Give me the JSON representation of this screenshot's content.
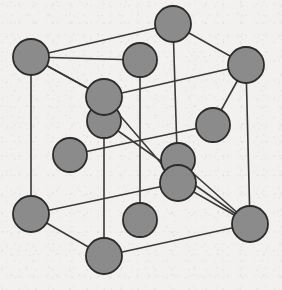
{
  "figure": {
    "canvas": {
      "width": 282,
      "height": 290
    },
    "style": {
      "background_color": "#f2f1ef",
      "atom_fill_color": "#8b8b8b",
      "atom_stroke_color": "#2b2b2b",
      "bond_line_color": "#3a3a3a",
      "atom_radius": 17,
      "bond_line_width": 1.6,
      "atom_stroke_width": 1.8
    },
    "counts": {
      "corner_atoms": 8,
      "face_center_atoms": 6,
      "total_atoms_drawn": 14,
      "cube_edges": 12
    },
    "atoms": [
      {
        "id": "corner-back-top-left",
        "role": "corner",
        "label": "A",
        "x": 31,
        "y": 57
      },
      {
        "id": "corner-front-top-left",
        "role": "corner",
        "label": "B",
        "x": 104,
        "y": 97
      },
      {
        "id": "corner-back-top-right",
        "role": "corner",
        "label": "C",
        "x": 173,
        "y": 24
      },
      {
        "id": "corner-front-top-right",
        "role": "corner",
        "label": "D",
        "x": 246,
        "y": 65
      },
      {
        "id": "corner-back-bottom-left",
        "role": "corner",
        "label": "E",
        "x": 31,
        "y": 214
      },
      {
        "id": "corner-front-bottom-left",
        "role": "corner",
        "label": "F",
        "x": 104,
        "y": 256
      },
      {
        "id": "corner-back-bottom-right",
        "role": "corner",
        "label": "G",
        "x": 178,
        "y": 183
      },
      {
        "id": "corner-front-bottom-right",
        "role": "corner",
        "label": "H",
        "x": 250,
        "y": 224
      },
      {
        "id": "face-center-top",
        "role": "face-center",
        "label": "I",
        "x": 140,
        "y": 60
      },
      {
        "id": "face-center-bottom",
        "role": "face-center",
        "label": "J",
        "x": 140,
        "y": 220
      },
      {
        "id": "face-center-left",
        "role": "face-center",
        "label": "K",
        "x": 70,
        "y": 155
      },
      {
        "id": "face-center-right",
        "role": "face-center",
        "label": "L",
        "x": 213,
        "y": 125
      },
      {
        "id": "face-center-back",
        "role": "face-center",
        "label": "M",
        "x": 104,
        "y": 121
      },
      {
        "id": "face-center-front",
        "role": "face-center",
        "label": "N",
        "x": 178,
        "y": 160
      }
    ],
    "bonds": [
      {
        "id": "edge-top-back",
        "kind": "cube-edge",
        "from": "corner-back-top-left",
        "to": "corner-back-top-right"
      },
      {
        "id": "edge-top-right",
        "kind": "cube-edge",
        "from": "corner-back-top-right",
        "to": "corner-front-top-right"
      },
      {
        "id": "edge-top-front",
        "kind": "cube-edge",
        "from": "corner-front-top-left",
        "to": "corner-front-top-right"
      },
      {
        "id": "edge-top-left",
        "kind": "cube-edge",
        "from": "corner-back-top-left",
        "to": "corner-front-top-left"
      },
      {
        "id": "edge-bottom-back",
        "kind": "cube-edge",
        "from": "corner-back-bottom-left",
        "to": "corner-back-bottom-right"
      },
      {
        "id": "edge-bottom-right",
        "kind": "cube-edge",
        "from": "corner-back-bottom-right",
        "to": "corner-front-bottom-right"
      },
      {
        "id": "edge-bottom-front",
        "kind": "cube-edge",
        "from": "corner-front-bottom-left",
        "to": "corner-front-bottom-right"
      },
      {
        "id": "edge-bottom-left",
        "kind": "cube-edge",
        "from": "corner-back-bottom-left",
        "to": "corner-front-bottom-left"
      },
      {
        "id": "edge-vert-back-left",
        "kind": "cube-edge",
        "from": "corner-back-top-left",
        "to": "corner-back-bottom-left"
      },
      {
        "id": "edge-vert-front-left",
        "kind": "cube-edge",
        "from": "corner-front-top-left",
        "to": "corner-front-bottom-left"
      },
      {
        "id": "edge-vert-back-right",
        "kind": "cube-edge",
        "from": "corner-back-top-right",
        "to": "corner-back-bottom-right"
      },
      {
        "id": "edge-vert-front-right",
        "kind": "cube-edge",
        "from": "corner-front-top-right",
        "to": "corner-front-bottom-right"
      },
      {
        "id": "diag-top-face",
        "kind": "face-diagonal",
        "from": "corner-back-top-left",
        "to": "face-center-top"
      },
      {
        "id": "diag-top-face-2",
        "kind": "face-diagonal",
        "from": "face-center-top",
        "to": "corner-front-top-right"
      },
      {
        "id": "stem-face-top",
        "kind": "face-stem",
        "from": "face-center-top",
        "to": "face-center-bottom"
      },
      {
        "id": "diag-back-face",
        "kind": "face-diagonal",
        "from": "corner-back-top-left",
        "to": "face-center-back"
      },
      {
        "id": "diag-back-face-2",
        "kind": "face-diagonal",
        "from": "face-center-back",
        "to": "corner-front-bottom-right"
      },
      {
        "id": "diag-left-face",
        "kind": "face-diagonal",
        "from": "face-center-left",
        "to": "face-center-right"
      },
      {
        "id": "diag-front-face",
        "kind": "face-diagonal",
        "from": "face-center-back",
        "to": "face-center-front"
      },
      {
        "id": "diag-right-face",
        "kind": "face-diagonal",
        "from": "corner-front-top-right",
        "to": "face-center-right"
      }
    ]
  }
}
